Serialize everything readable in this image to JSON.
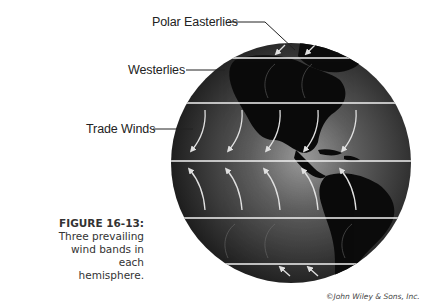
{
  "figure": {
    "number": "FIGURE 16-13:",
    "caption": "Three prevailing wind bands in each hemisphere.",
    "credit": "©John Wiley & Sons, Inc."
  },
  "labels": {
    "polar_easterlies": "Polar Easterlies",
    "westerlies": "Westerlies",
    "trade_winds": "Trade Winds"
  },
  "globe": {
    "center": [
      291,
      163
    ],
    "radius": 120,
    "band_lines_y": [
      58,
      103,
      161,
      218,
      264
    ],
    "colors": {
      "ocean_dark": "#1a1a1a",
      "ocean_light": "#8a8a8a",
      "land": "#0a0a0a",
      "band_line": "#f2f2f2",
      "arrow": "#e0e0e0"
    }
  }
}
